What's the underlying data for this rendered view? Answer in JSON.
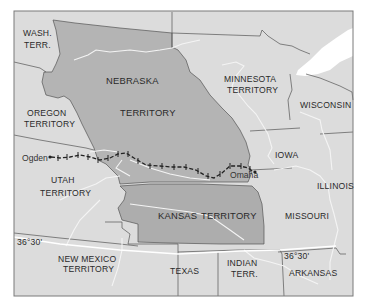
{
  "map": {
    "title": "Kansas-Nebraska Act territories and Union Pacific route",
    "colors": {
      "background": "#ffffff",
      "land": "#dcdcdc",
      "highlighted_territory": "#b4b4b4",
      "kansas_territory": "#adadad",
      "water": "#ffffff",
      "border": "#555555",
      "river": "#f4f4f4",
      "railroad": "#222222",
      "frame": "#7a7a7a"
    },
    "regions": {
      "wash_terr_line1": "WASH.",
      "wash_terr_line2": "TERR.",
      "oregon_line1": "OREGON",
      "oregon_line2": "TERRITORY",
      "nebraska_line1": "NEBRASKA",
      "nebraska_line2": "TERRITORY",
      "minnesota_line1": "MINNESOTA",
      "minnesota_line2": "TERRITORY",
      "wisconsin": "WISCONSIN",
      "iowa": "IOWA",
      "illinois": "ILLINOIS",
      "utah_line1": "UTAH",
      "utah_line2": "TERRITORY",
      "kansas_line1": "KANSAS",
      "kansas_line2": "TERRITORY",
      "missouri": "MISSOURI",
      "new_mexico_line1": "NEW MEXICO",
      "new_mexico_line2": "TERRITORY",
      "texas": "TEXAS",
      "indian_line1": "INDIAN",
      "indian_line2": "TERR.",
      "arkansas": "ARKANSAS"
    },
    "cities": {
      "ogden": "Ogden",
      "omaha": "Omaha"
    },
    "parallel_labels": {
      "west": "36°30'",
      "east": "36°30'"
    },
    "legend_features": [
      "railroad-route",
      "state-borders",
      "rivers",
      "36-30-parallel"
    ]
  }
}
